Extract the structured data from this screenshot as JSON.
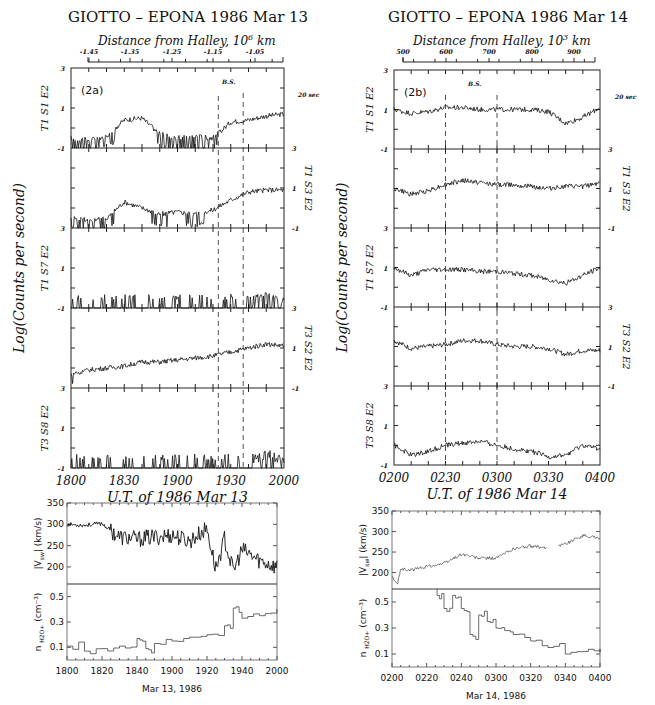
{
  "figures": [
    {
      "id": "2a",
      "title": "GIOTTO – EPONA   1986 Mar 13",
      "top_axis_label": "Distance from Halley, 10",
      "top_axis_exp": "6",
      "top_axis_unit": " km",
      "top_ticks": [
        "-1.45",
        "-1.35",
        "-1.25",
        "-1.15",
        "-1.05"
      ],
      "panel_tag": "(2a)",
      "bs_label": "B.S.",
      "sec_label": "20 sec",
      "ylabel": "Log(Counts per second)",
      "xlabel": "U.T. of 1986 Mar 13",
      "x_ticks": [
        "1800",
        "1830",
        "1900",
        "1930",
        "2000"
      ],
      "bottom_xlabel": "Mar 13, 1986",
      "bottom_x_ticks": [
        "1800",
        "1820",
        "1840",
        "1900",
        "1920",
        "1940",
        "2000"
      ]
    },
    {
      "id": "2b",
      "title": "GIOTTO – EPONA   1986 Mar 14",
      "top_axis_label": "Distance from Halley, 10",
      "top_axis_exp": "3",
      "top_axis_unit": " km",
      "top_ticks": [
        "500",
        "600",
        "700",
        "800",
        "900"
      ],
      "panel_tag": "(2b)",
      "bs_label": "B.S.",
      "sec_label": "20 sec",
      "ylabel": "Log(Counts per second)",
      "xlabel": "U.T. of 1986 Mar 14",
      "x_ticks": [
        "0200",
        "0230",
        "0300",
        "0330",
        "0400"
      ],
      "bottom_xlabel": "Mar 14, 1986",
      "bottom_x_ticks": [
        "0200",
        "0220",
        "0240",
        "0300",
        "0320",
        "0340",
        "0400"
      ]
    }
  ],
  "chart_data": [
    {
      "type": "line",
      "title": "GIOTTO - EPONA 1986 Mar 13 (2a)",
      "xlabel": "U.T. of 1986 Mar 13",
      "ylabel": "Log(Counts per second)",
      "top_axis": "Distance from Halley, 10^6 km",
      "x": [
        "1800",
        "1810",
        "1820",
        "1830",
        "1840",
        "1850",
        "1900",
        "1910",
        "1920",
        "1930",
        "1940",
        "1950",
        "2000"
      ],
      "ylim": [
        -1,
        3
      ],
      "bow_shock_markers_ut": [
        "1923",
        "1937"
      ],
      "series": [
        {
          "name": "T1 S1 E2",
          "values": [
            -0.5,
            -0.6,
            -0.4,
            0.4,
            0.5,
            -0.3,
            -0.5,
            -0.4,
            -0.5,
            0.3,
            0.4,
            0.6,
            0.7
          ]
        },
        {
          "name": "T1 S3 E2",
          "values": [
            -0.4,
            -0.6,
            -0.5,
            0.3,
            0.0,
            -0.3,
            -0.2,
            -0.3,
            -0.1,
            0.4,
            0.8,
            0.9,
            0.9
          ]
        },
        {
          "name": "T1 S7 E2",
          "values": [
            -0.8,
            -0.9,
            -0.9,
            -0.9,
            -0.8,
            -0.8,
            -0.8,
            -0.8,
            -0.8,
            -0.8,
            -0.7,
            -0.3,
            -0.6
          ]
        },
        {
          "name": "T3 S2 E2",
          "values": [
            -0.3,
            -0.1,
            0.0,
            0.1,
            0.3,
            0.3,
            0.4,
            0.5,
            0.6,
            0.8,
            1.0,
            1.2,
            1.1
          ]
        },
        {
          "name": "T3 S8 E2",
          "values": [
            -0.8,
            -0.9,
            -0.8,
            -0.9,
            -0.9,
            -0.8,
            -0.8,
            -0.7,
            -0.8,
            -0.8,
            -0.7,
            -0.3,
            -0.6
          ]
        }
      ]
    },
    {
      "type": "line",
      "title": "GIOTTO - EPONA 1986 Mar 14 (2b)",
      "xlabel": "U.T. of 1986 Mar 14",
      "ylabel": "Log(Counts per second)",
      "top_axis": "Distance from Halley, 10^3 km",
      "x": [
        "0200",
        "0210",
        "0220",
        "0230",
        "0240",
        "0250",
        "0300",
        "0310",
        "0320",
        "0330",
        "0340",
        "0350",
        "0400"
      ],
      "ylim": [
        -1,
        3
      ],
      "bow_shock_markers_ut": [
        "0230",
        "0300"
      ],
      "series": [
        {
          "name": "T1 S1 E2",
          "values": [
            1.0,
            0.8,
            0.9,
            1.1,
            1.1,
            1.0,
            1.0,
            1.0,
            1.0,
            0.9,
            0.3,
            0.6,
            1.1
          ]
        },
        {
          "name": "T1 S3 E2",
          "values": [
            1.0,
            0.7,
            0.9,
            1.2,
            1.4,
            1.3,
            1.2,
            1.2,
            1.1,
            1.0,
            1.1,
            1.1,
            1.3
          ]
        },
        {
          "name": "T1 S7 E2",
          "values": [
            1.0,
            0.6,
            0.9,
            0.9,
            0.9,
            0.8,
            0.8,
            0.7,
            0.6,
            0.4,
            0.2,
            0.6,
            1.0
          ]
        },
        {
          "name": "T3 S2 E2",
          "values": [
            1.3,
            0.9,
            1.0,
            1.1,
            1.3,
            1.3,
            1.1,
            1.0,
            1.0,
            0.9,
            0.6,
            0.8,
            0.8
          ]
        },
        {
          "name": "T3 S8 E2",
          "values": [
            0.0,
            -0.5,
            -0.3,
            0.0,
            0.1,
            0.2,
            0.0,
            -0.2,
            -0.3,
            -0.6,
            -0.5,
            0.0,
            -0.2
          ]
        }
      ]
    },
    {
      "type": "line",
      "title": "Solar wind speed, Mar 13 1986",
      "xlabel": "Mar 13, 1986",
      "ylabel": "|V_sw| (km/s)",
      "x": [
        "1800",
        "1810",
        "1820",
        "1830",
        "1840",
        "1850",
        "1900",
        "1910",
        "1920",
        "1925",
        "1930",
        "1935",
        "1940",
        "1950",
        "2000"
      ],
      "values": [
        300,
        298,
        302,
        270,
        265,
        270,
        275,
        260,
        290,
        195,
        265,
        190,
        240,
        215,
        200
      ],
      "ylim": [
        160,
        350
      ],
      "yticks": [
        200,
        250,
        300,
        350
      ]
    },
    {
      "type": "line",
      "title": "H2O+ density, Mar 13 1986",
      "xlabel": "Mar 13, 1986",
      "ylabel": "n H2O+ (cm^-3)",
      "x": [
        "1800",
        "1810",
        "1820",
        "1830",
        "1840",
        "1845",
        "1850",
        "1900",
        "1910",
        "1920",
        "1930",
        "1935",
        "1940",
        "1950",
        "2000"
      ],
      "values": [
        0.11,
        0.07,
        0.09,
        0.11,
        0.17,
        0.09,
        0.13,
        0.15,
        0.18,
        0.2,
        0.27,
        0.41,
        0.33,
        0.35,
        0.38
      ],
      "ylim": [
        0.0,
        0.6
      ],
      "yticks": [
        0.1,
        0.3,
        0.5
      ]
    },
    {
      "type": "line",
      "title": "Solar wind speed, Mar 14 1986",
      "xlabel": "Mar 14, 1986",
      "ylabel": "|V_sw| (km/s)",
      "x": [
        "0200",
        "0203",
        "0205",
        "0210",
        "0220",
        "0230",
        "0240",
        "0250",
        "0300",
        "0310",
        "0320",
        "0330",
        "0340",
        "0350",
        "0400"
      ],
      "values": [
        190,
        170,
        210,
        205,
        215,
        222,
        245,
        235,
        235,
        258,
        265,
        258,
        270,
        290,
        285
      ],
      "ylim": [
        160,
        350
      ],
      "yticks": [
        200,
        250,
        300,
        350
      ]
    },
    {
      "type": "line",
      "title": "H2O+ density, Mar 14 1986",
      "xlabel": "Mar 14, 1986",
      "ylabel": "n H2O+ (cm^-3)",
      "x": [
        "0226",
        "0230",
        "0235",
        "0240",
        "0245",
        "0250",
        "0255",
        "0300",
        "0305",
        "0310",
        "0320",
        "0330",
        "0340",
        "0350",
        "0400"
      ],
      "values": [
        0.55,
        0.45,
        0.55,
        0.45,
        0.25,
        0.4,
        0.35,
        0.3,
        0.28,
        0.25,
        0.2,
        0.15,
        0.1,
        0.12,
        0.12
      ],
      "ylim": [
        0.0,
        0.6
      ],
      "yticks": [
        0.1,
        0.3,
        0.5
      ]
    }
  ],
  "ylabels_left": [
    "T1 S1 E2",
    "T1 S7 E2",
    "T3 S8 E2"
  ],
  "ylabels_right": [
    "T1 S3 E2",
    "T3 S2 E2"
  ],
  "bottom_ylabel_top": "|V",
  "bottom_ylabel_top_sub": "sw",
  "bottom_ylabel_top_unit": "| (km/s)",
  "bottom_ylabel_bot": "n",
  "bottom_ylabel_bot_sub": "H2O+",
  "bottom_ylabel_bot_unit": "(cm⁻³)",
  "count_tick_labels": [
    "3",
    "1",
    "-1"
  ],
  "speed_ticks": [
    "350",
    "300",
    "250",
    "200"
  ],
  "density_ticks": [
    "0.5",
    "0.3",
    "0.1"
  ]
}
